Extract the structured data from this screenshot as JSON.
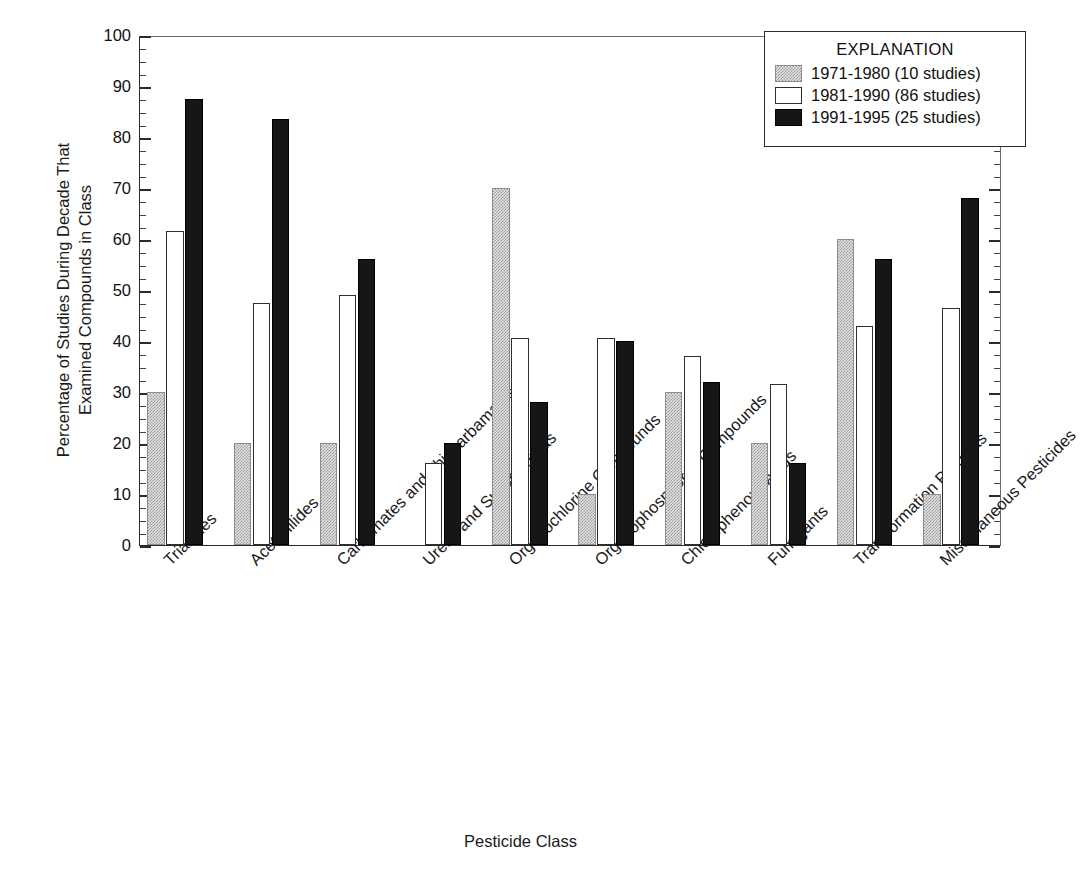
{
  "chart_data": {
    "type": "bar",
    "title": "",
    "xlabel": "Pesticide Class",
    "ylabel": "Percentage of Studies During Decade That Examined Compounds in Class",
    "ylabel_line1": "Percentage of Studies During Decade That",
    "ylabel_line2": "Examined Compounds in Class",
    "ylim": [
      0,
      100
    ],
    "ytick_step": 10,
    "yminor_step": 2.5,
    "grid": false,
    "legend_position": "top-right",
    "legend_title": "EXPLANATION",
    "categories": [
      "Triazines",
      "Acetanilides",
      "Carbamates and Thiocarbamates",
      "Ureas and Sulfonylureas",
      "Organochlorine Compounds",
      "Organophosphorus Compounds",
      "Chlorophenoxy Acids",
      "Fumigants",
      "Transformation Products",
      "Miscellaneous Pesticides"
    ],
    "ytick_labels": [
      "0",
      "10",
      "20",
      "30",
      "40",
      "50",
      "60",
      "70",
      "80",
      "90",
      "100"
    ],
    "series": [
      {
        "name": "1971-1980 (10 studies)",
        "color": "#e3e3e3",
        "values": [
          30,
          20,
          20,
          0,
          70,
          10,
          30,
          20,
          60,
          10
        ]
      },
      {
        "name": "1981-1990 (86 studies)",
        "color": "#ffffff",
        "values": [
          61.5,
          47.5,
          49,
          16,
          40.5,
          40.5,
          37,
          31.5,
          43,
          46.5
        ]
      },
      {
        "name": "1991-1995 (25 studies)",
        "color": "#161616",
        "values": [
          87.5,
          83.5,
          56,
          20,
          28,
          40,
          32,
          16,
          56,
          68
        ]
      }
    ]
  }
}
